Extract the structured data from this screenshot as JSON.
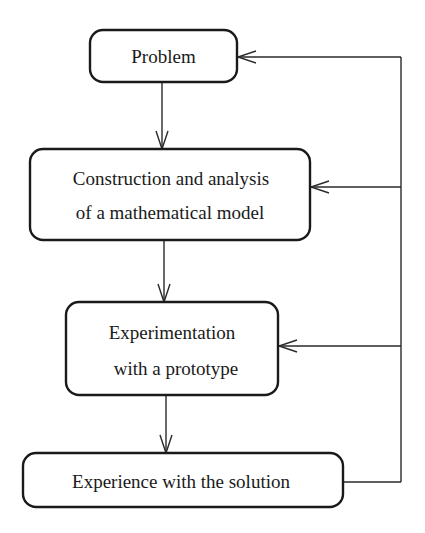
{
  "diagram": {
    "type": "flowchart",
    "nodes": [
      {
        "id": "problem",
        "lines": [
          "Problem"
        ]
      },
      {
        "id": "model",
        "lines": [
          "Construction and analysis",
          "of a mathematical model"
        ]
      },
      {
        "id": "prototype",
        "lines": [
          "Experimentation",
          "with a prototype"
        ]
      },
      {
        "id": "solution",
        "lines": [
          "Experience with the solution"
        ]
      }
    ],
    "edges": [
      {
        "from": "problem",
        "to": "model",
        "kind": "forward"
      },
      {
        "from": "model",
        "to": "prototype",
        "kind": "forward"
      },
      {
        "from": "prototype",
        "to": "solution",
        "kind": "forward"
      },
      {
        "from": "solution",
        "to": "problem",
        "kind": "feedback"
      },
      {
        "from": "solution",
        "to": "model",
        "kind": "feedback"
      },
      {
        "from": "solution",
        "to": "prototype",
        "kind": "feedback"
      }
    ],
    "colors": {
      "stroke": "#1a1a1a",
      "background": "#ffffff"
    }
  }
}
